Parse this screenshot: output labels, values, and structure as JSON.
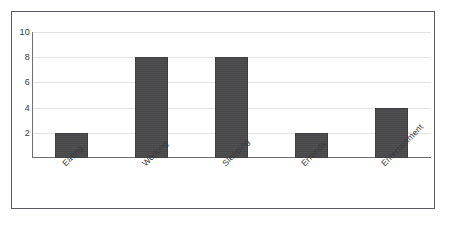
{
  "chart_data": {
    "type": "bar",
    "title": "",
    "xlabel": "",
    "ylabel": "",
    "categories": [
      "Eating",
      "Working",
      "Sleeping",
      "Errands",
      "Entertainment"
    ],
    "values": [
      2,
      8,
      8,
      2,
      4
    ],
    "series": [
      {
        "name": "Hours",
        "values": [
          2,
          8,
          8,
          2,
          4
        ]
      }
    ],
    "ylim": [
      0,
      10
    ],
    "yticks": [
      2,
      4,
      6,
      8,
      10
    ],
    "ytick_labels": [
      "2",
      "4",
      "6",
      "8",
      "10"
    ],
    "grid": true,
    "legend": false,
    "legend_position": "none",
    "bar_color": "#4a4a4c",
    "gridline_color": "#e3e3e6",
    "axis_color": "#6e6e73",
    "frame_color": "#5a5a60",
    "background_color": "#ffffff",
    "xtick_label_rotation": -45
  }
}
